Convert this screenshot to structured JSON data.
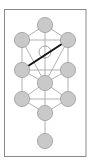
{
  "diagram": {
    "type": "tree-of-life",
    "frame": {
      "x": 4.5,
      "y": 9.5,
      "width": 81.5,
      "height": 147,
      "stroke": "#8a8a8a"
    },
    "colors": {
      "node_fill": "#c9c9c9",
      "node_stroke": "#9a9a9a",
      "path_stroke": "#a8a8a8",
      "highlight_stroke": "#111111",
      "daath_stroke": "#9a9a9a",
      "background": "#ffffff"
    },
    "node_radius": 7.6,
    "nodes": [
      {
        "id": "kether",
        "x": 45,
        "y": 25
      },
      {
        "id": "binah",
        "x": 22,
        "y": 40
      },
      {
        "id": "chokmah",
        "x": 68,
        "y": 40
      },
      {
        "id": "geburah",
        "x": 22,
        "y": 70
      },
      {
        "id": "chesed",
        "x": 68,
        "y": 70
      },
      {
        "id": "tiphareth",
        "x": 45,
        "y": 83
      },
      {
        "id": "hod",
        "x": 22,
        "y": 99
      },
      {
        "id": "netzach",
        "x": 68,
        "y": 99
      },
      {
        "id": "yesod",
        "x": 45,
        "y": 113
      },
      {
        "id": "malkuth",
        "x": 45,
        "y": 141
      }
    ],
    "daath": {
      "id": "daath",
      "x": 45,
      "y": 52,
      "r": 6
    },
    "paths": [
      [
        "kether",
        "binah"
      ],
      [
        "kether",
        "chokmah"
      ],
      [
        "kether",
        "tiphareth"
      ],
      [
        "binah",
        "chokmah"
      ],
      [
        "binah",
        "geburah"
      ],
      [
        "binah",
        "tiphareth"
      ],
      [
        "chokmah",
        "chesed"
      ],
      [
        "chokmah",
        "tiphareth"
      ],
      [
        "geburah",
        "chesed"
      ],
      [
        "geburah",
        "tiphareth"
      ],
      [
        "geburah",
        "hod"
      ],
      [
        "chesed",
        "tiphareth"
      ],
      [
        "chesed",
        "netzach"
      ],
      [
        "tiphareth",
        "hod"
      ],
      [
        "tiphareth",
        "netzach"
      ],
      [
        "tiphareth",
        "yesod"
      ],
      [
        "hod",
        "netzach"
      ],
      [
        "hod",
        "yesod"
      ],
      [
        "netzach",
        "yesod"
      ],
      [
        "yesod",
        "malkuth"
      ]
    ],
    "highlighted_path": [
      "chokmah",
      "geburah"
    ]
  }
}
